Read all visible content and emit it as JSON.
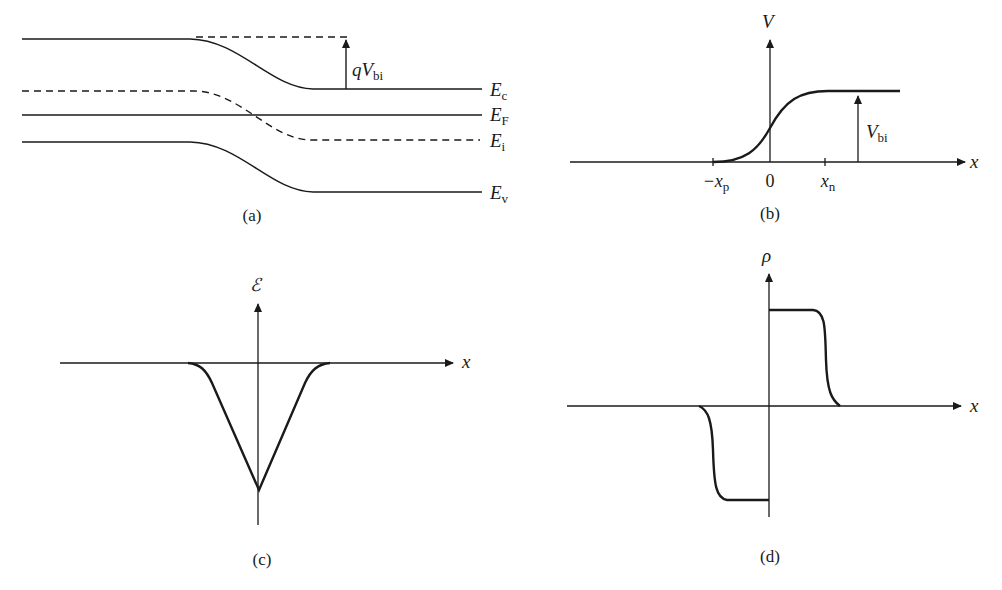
{
  "figure": {
    "panels": [
      {
        "id": "a",
        "caption": "(a)",
        "title": "Energy band diagram of p-n junction",
        "labels": {
          "Ec": {
            "main": "E",
            "sub": "c"
          },
          "EF": {
            "main": "E",
            "sub": "F"
          },
          "Ei": {
            "main": "E",
            "sub": "i"
          },
          "Ev": {
            "main": "E",
            "sub": "v"
          },
          "qVbi": {
            "main": "qV",
            "sub": "bi"
          }
        }
      },
      {
        "id": "b",
        "caption": "(b)",
        "axis_y": "V",
        "axis_x": "x",
        "ticks": [
          {
            "main": "−x",
            "sub": "p"
          },
          {
            "main": "0",
            "sub": ""
          },
          {
            "main": "x",
            "sub": "n"
          }
        ],
        "annotation": {
          "main": "V",
          "sub": "bi"
        }
      },
      {
        "id": "c",
        "caption": "(c)",
        "axis_y": "ℰ",
        "axis_x": "x"
      },
      {
        "id": "d",
        "caption": "(d)",
        "axis_y": "ρ",
        "axis_x": "x"
      }
    ]
  },
  "colors": {
    "ink": "#1a1a1a",
    "background": "#ffffff"
  }
}
